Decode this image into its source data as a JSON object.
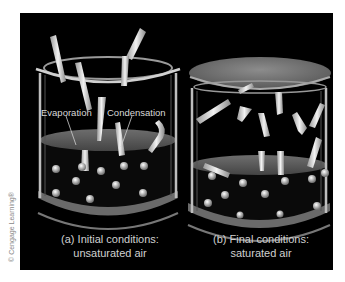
{
  "figure": {
    "credit": "© Cengage Learning®",
    "colors": {
      "background": "#000000",
      "page": "#ffffff",
      "glass": "#bfbfbf",
      "water": "#6a6a6a",
      "lid": "#7a7a7a",
      "molecule": "#e0e0e0",
      "text": "#d8d8d8"
    },
    "beakers": [
      {
        "id": "a",
        "has_lid": false,
        "labels": {
          "evaporation": "Evaporation",
          "condensation": "Condensation"
        },
        "caption_line1": "(a) Initial conditions:",
        "caption_line2": "unsaturated air"
      },
      {
        "id": "b",
        "has_lid": true,
        "caption_line1": "(b) Final conditions:",
        "caption_line2": "saturated air"
      }
    ]
  }
}
